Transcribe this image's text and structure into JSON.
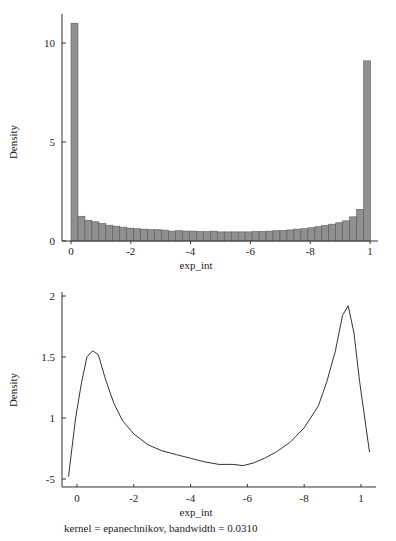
{
  "chart_data": [
    {
      "type": "bar",
      "subtype": "histogram",
      "title": "",
      "xlabel": "exp_int",
      "ylabel": "Density",
      "xlim": [
        0,
        1
      ],
      "ylim": [
        0,
        11.5
      ],
      "x_ticks": [
        {
          "value": 0,
          "label": "0"
        },
        {
          "value": 0.2,
          "label": "-2"
        },
        {
          "value": 0.4,
          "label": "-4"
        },
        {
          "value": 0.6,
          "label": "-6"
        },
        {
          "value": 0.8,
          "label": "-8"
        },
        {
          "value": 1.0,
          "label": "1"
        }
      ],
      "y_ticks": [
        {
          "value": 0,
          "label": "0"
        },
        {
          "value": 5,
          "label": "5"
        },
        {
          "value": 10,
          "label": "10"
        }
      ],
      "bin_start": 0,
      "bin_width": 0.0233,
      "values": [
        11.0,
        1.25,
        1.05,
        0.97,
        0.88,
        0.8,
        0.75,
        0.7,
        0.65,
        0.62,
        0.6,
        0.58,
        0.57,
        0.55,
        0.5,
        0.52,
        0.5,
        0.5,
        0.48,
        0.47,
        0.5,
        0.46,
        0.46,
        0.46,
        0.46,
        0.46,
        0.48,
        0.48,
        0.5,
        0.52,
        0.54,
        0.56,
        0.6,
        0.62,
        0.67,
        0.72,
        0.78,
        0.85,
        0.92,
        1.02,
        1.22,
        1.6,
        9.1
      ],
      "grid": false
    },
    {
      "type": "line",
      "subtype": "kernel-density",
      "title": "",
      "xlabel": "exp_int",
      "ylabel": "Density",
      "xlim": [
        -0.035,
        1.04
      ],
      "ylim": [
        0.45,
        2.05
      ],
      "x_ticks": [
        {
          "value": 0,
          "label": "0"
        },
        {
          "value": 0.2,
          "label": "-2"
        },
        {
          "value": 0.4,
          "label": "-4"
        },
        {
          "value": 0.6,
          "label": "-6"
        },
        {
          "value": 0.8,
          "label": "-8"
        },
        {
          "value": 1.0,
          "label": "1"
        }
      ],
      "y_ticks": [
        {
          "value": 0.5,
          "label": "-5"
        },
        {
          "value": 1.0,
          "label": "1"
        },
        {
          "value": 1.5,
          "label": "1.5"
        },
        {
          "value": 2.0,
          "label": "2"
        }
      ],
      "x": [
        -0.03,
        -0.005,
        0.015,
        0.035,
        0.055,
        0.075,
        0.1,
        0.13,
        0.16,
        0.2,
        0.25,
        0.3,
        0.35,
        0.4,
        0.45,
        0.5,
        0.55,
        0.585,
        0.62,
        0.66,
        0.7,
        0.75,
        0.8,
        0.85,
        0.88,
        0.91,
        0.935,
        0.955,
        0.975,
        0.995,
        1.03
      ],
      "y": [
        0.52,
        1.0,
        1.28,
        1.5,
        1.55,
        1.52,
        1.32,
        1.12,
        0.98,
        0.87,
        0.78,
        0.73,
        0.7,
        0.67,
        0.64,
        0.62,
        0.62,
        0.61,
        0.63,
        0.67,
        0.72,
        0.8,
        0.92,
        1.1,
        1.3,
        1.55,
        1.84,
        1.92,
        1.7,
        1.3,
        0.72
      ],
      "annotation": "kernel = epanechnikov, bandwidth = 0.0310",
      "grid": false
    }
  ]
}
